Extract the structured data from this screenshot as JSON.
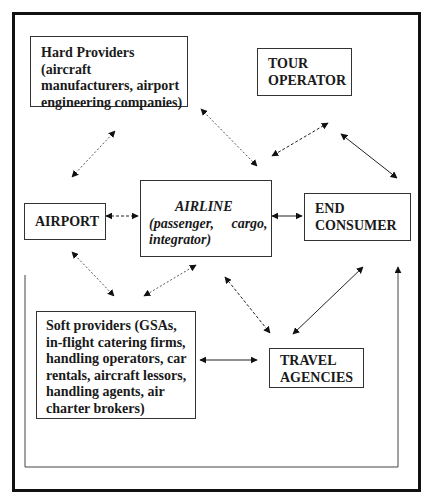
{
  "diagram": {
    "type": "stakeholder-relationship-diagram",
    "nodes": {
      "hard_providers": {
        "lines": [
          "Hard Providers (aircraft",
          "manufacturers, airport",
          "engineering companies)"
        ]
      },
      "tour_operator": {
        "lines": [
          "TOUR",
          "OPERATOR"
        ]
      },
      "airport": {
        "label": "AIRPORT"
      },
      "airline": {
        "title": "AIRLINE",
        "lines": [
          "(passenger,     cargo,",
          "integrator)"
        ]
      },
      "end_consumer": {
        "lines": [
          "END",
          "CONSUMER"
        ]
      },
      "soft_providers": {
        "lines": [
          "Soft providers (GSAs,",
          "in-flight catering firms,",
          "handling operators, car",
          "rentals, aircraft lessors,",
          "handling agents, air",
          "charter brokers)"
        ]
      },
      "travel_agencies": {
        "lines": [
          "TRAVEL",
          "AGENCIES"
        ]
      }
    },
    "edges": [
      {
        "from": "hard_providers",
        "to": "airport",
        "style": "dotted",
        "direction": "both"
      },
      {
        "from": "hard_providers",
        "to": "airline",
        "style": "dotted",
        "direction": "both"
      },
      {
        "from": "tour_operator",
        "to": "airline",
        "style": "dashed",
        "direction": "both"
      },
      {
        "from": "tour_operator",
        "to": "end_consumer",
        "style": "solid",
        "direction": "both"
      },
      {
        "from": "airport",
        "to": "airline",
        "style": "dashed",
        "direction": "both"
      },
      {
        "from": "airline",
        "to": "end_consumer",
        "style": "solid",
        "direction": "both"
      },
      {
        "from": "airport",
        "to": "soft_providers",
        "style": "dotted",
        "direction": "forward"
      },
      {
        "from": "airline",
        "to": "soft_providers",
        "style": "dotted",
        "direction": "both"
      },
      {
        "from": "airline",
        "to": "travel_agencies",
        "style": "dashed",
        "direction": "both"
      },
      {
        "from": "soft_providers",
        "to": "travel_agencies",
        "style": "solid",
        "direction": "both"
      },
      {
        "from": "travel_agencies",
        "to": "end_consumer",
        "style": "solid",
        "direction": "both"
      },
      {
        "from": "left-border-loop",
        "to": "end_consumer",
        "style": "solid",
        "direction": "forward"
      }
    ]
  }
}
